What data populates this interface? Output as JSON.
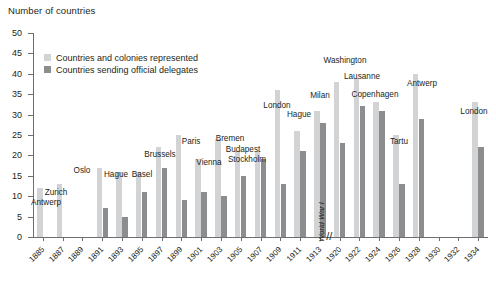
{
  "chart_data": {
    "type": "bar",
    "title": "",
    "ylabel": "Number of countries",
    "xlabel": "",
    "ylim": [
      0,
      50
    ],
    "ytick_step": 5,
    "yticks": [
      0,
      5,
      10,
      15,
      20,
      25,
      30,
      35,
      40,
      45,
      50
    ],
    "grid": false,
    "legend_position": "upper-left-inside",
    "axis_break_after_category": "1913",
    "axis_break_marker": "//",
    "annotations": [
      {
        "text": "World War I",
        "rotated": true,
        "at_category": "1913",
        "style": "italic"
      }
    ],
    "categories": [
      "1885",
      "1887",
      "1889",
      "1891",
      "1893",
      "1895",
      "1897",
      "1899",
      "1901",
      "1903",
      "1905",
      "1907",
      "1909",
      "1911",
      "1913",
      "1920",
      "1922",
      "1924",
      "1926",
      "1928",
      "1930",
      "1932",
      "1934"
    ],
    "tick_labels": [
      "1885",
      "1887",
      "1889",
      "1891",
      "1893",
      "1895",
      "1897",
      "1899",
      "1901",
      "1903",
      "1905",
      "1907",
      "1909",
      "1911",
      "1913",
      "1920",
      "1922",
      "1924",
      "1926",
      "1928",
      "1930",
      "1932",
      "1934"
    ],
    "series": [
      {
        "name": "Countries and colonies represented",
        "color": "#d2d3d5",
        "values": [
          12,
          13,
          null,
          17,
          16,
          16,
          22,
          25,
          19,
          24,
          21,
          21,
          36,
          26,
          31,
          38,
          39,
          33,
          25,
          40,
          null,
          null,
          33
        ]
      },
      {
        "name": "Countries sending official delegates",
        "color": "#8b8d8f",
        "values": [
          null,
          null,
          null,
          7,
          5,
          11,
          17,
          9,
          11,
          10,
          15,
          19,
          13,
          21,
          28,
          23,
          32,
          31,
          13,
          29,
          null,
          null,
          22
        ]
      }
    ],
    "point_labels": [
      {
        "category": "1885",
        "text": "Antwerp"
      },
      {
        "category": "1887",
        "text": "Zurich"
      },
      {
        "category": "1891",
        "text": "Oslo"
      },
      {
        "category": "1895",
        "text": "Hague"
      },
      {
        "category": "1897",
        "text": "Basel"
      },
      {
        "category": "1899",
        "text": "Brussels"
      },
      {
        "category": "1901",
        "text": "Paris"
      },
      {
        "category": "1903",
        "text": "Vienna"
      },
      {
        "category": "1905",
        "text": "Bremen"
      },
      {
        "category": "1907",
        "text": "Budapest"
      },
      {
        "category": "1907",
        "text": "Stockholm"
      },
      {
        "category": "1909",
        "text": "London"
      },
      {
        "category": "1911",
        "text": "Hague"
      },
      {
        "category": "1913",
        "text": "Milan"
      },
      {
        "category": "1920",
        "text": "Washington"
      },
      {
        "category": "1922",
        "text": "Lausanne"
      },
      {
        "category": "1924",
        "text": "Copenhagen"
      },
      {
        "category": "1926",
        "text": "Tartu"
      },
      {
        "category": "1928",
        "text": "Antwerp"
      },
      {
        "category": "1934",
        "text": "London"
      }
    ]
  },
  "legend": {
    "items": [
      {
        "label": "Countries and colonies represented",
        "color": "#d2d3d5"
      },
      {
        "label": "Countries sending official delegates",
        "color": "#8b8d8f"
      }
    ]
  },
  "city_labels": [
    {
      "text": "Antwerp",
      "x": 46,
      "y": 198
    },
    {
      "text": "Zurich",
      "x": 56,
      "y": 188
    },
    {
      "text": "Oslo",
      "x": 82,
      "y": 166
    },
    {
      "text": "Hague",
      "x": 116,
      "y": 170
    },
    {
      "text": "Basel",
      "x": 142,
      "y": 170
    },
    {
      "text": "Brussels",
      "x": 160,
      "y": 150
    },
    {
      "text": "Paris",
      "x": 191,
      "y": 137
    },
    {
      "text": "Vienna",
      "x": 209,
      "y": 158
    },
    {
      "text": "Bremen",
      "x": 230,
      "y": 134
    },
    {
      "text": "Budapest",
      "x": 243,
      "y": 145
    },
    {
      "text": "Stockholm",
      "x": 247,
      "y": 155
    },
    {
      "text": "London",
      "x": 277,
      "y": 101
    },
    {
      "text": "Hague",
      "x": 299,
      "y": 110
    },
    {
      "text": "Milan",
      "x": 320,
      "y": 91
    },
    {
      "text": "Washington",
      "x": 345,
      "y": 56
    },
    {
      "text": "Lausanne",
      "x": 362,
      "y": 72
    },
    {
      "text": "Copenhagen",
      "x": 375,
      "y": 90
    },
    {
      "text": "Tartu",
      "x": 399,
      "y": 137
    },
    {
      "text": "Antwerp",
      "x": 422,
      "y": 79
    },
    {
      "text": "London",
      "x": 474,
      "y": 107
    }
  ],
  "axis_break": {
    "marker": "//"
  },
  "war_annotation": {
    "text": "World War I"
  }
}
